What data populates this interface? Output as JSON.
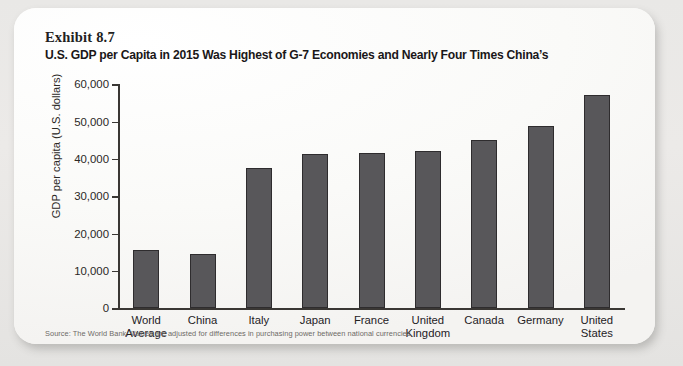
{
  "exhibit": {
    "label": "Exhibit 8.7",
    "title": "U.S. GDP per Capita in 2015 Was Highest of G-7 Economies and Nearly Four Times China’s"
  },
  "source_note": "Source: The World Bank. Values are adjusted for differences in purchasing power between national currencies.",
  "chart_data": {
    "type": "bar",
    "title": "U.S. GDP per Capita in 2015 Was Highest of G-7 Economies and Nearly Four Times China’s",
    "xlabel": "",
    "ylabel": "GDP per capita (U.S. dollars)",
    "categories": [
      "World Average",
      "China",
      "Italy",
      "Japan",
      "France",
      "United Kingdom",
      "Canada",
      "Germany",
      "United States"
    ],
    "category_lines": [
      [
        "World",
        "Average"
      ],
      [
        "China",
        ""
      ],
      [
        "Italy",
        ""
      ],
      [
        "Japan",
        ""
      ],
      [
        "France",
        ""
      ],
      [
        "United",
        "Kingdom"
      ],
      [
        "Canada",
        ""
      ],
      [
        "Germany",
        ""
      ],
      [
        "United",
        "States"
      ]
    ],
    "values": [
      15700,
      14600,
      37500,
      41400,
      41500,
      42300,
      45000,
      48900,
      57300
    ],
    "ylim": [
      0,
      60000
    ],
    "ytick_values": [
      0,
      10000,
      20000,
      30000,
      40000,
      50000,
      60000
    ],
    "ytick_labels": [
      "0",
      "10,000",
      "20,000",
      "30,000",
      "40,000",
      "50,000",
      "60,000"
    ],
    "grid": false,
    "legend": null,
    "bar_color": "#58575a",
    "bar_edge_color": "#2e2c2e"
  }
}
